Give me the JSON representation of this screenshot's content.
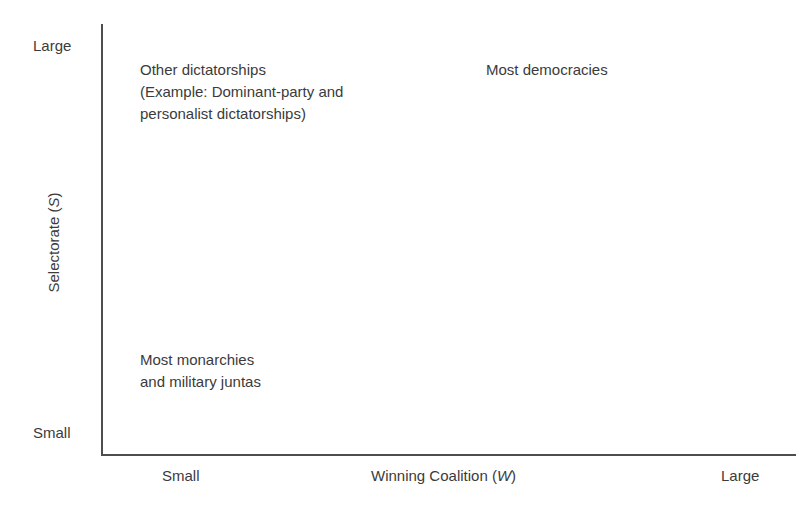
{
  "figure": {
    "background_color": "#ffffff",
    "text_color": "#3b3b3b",
    "axis_color": "#4d4d4d"
  },
  "chart_data": {
    "type": "scatter",
    "title": "",
    "xlabel": "Winning Coalition (W)",
    "ylabel": "Selectorate (S)",
    "xlabel_text": "Winning Coalition (",
    "xlabel_var": "W",
    "xlabel_tail": ")",
    "ylabel_text": "Selectorate (",
    "ylabel_var": "S",
    "ylabel_tail": ")",
    "x_ticks": [
      "Small",
      "Large"
    ],
    "y_ticks": [
      "Small",
      "Large"
    ],
    "grid": false,
    "legend": "none",
    "annotations": [
      {
        "label": "Other dictatorships\n(Example: Dominant-party and\npersonalist dictatorships)",
        "quadrant": "top-left",
        "x": "small W",
        "y": "large S"
      },
      {
        "label": "Most democracies",
        "quadrant": "top-right",
        "x": "large W",
        "y": "large S"
      },
      {
        "label": "Most monarchies\nand military juntas",
        "quadrant": "bottom-left",
        "x": "small W",
        "y": "small S"
      }
    ]
  },
  "axes": {
    "y_top_label": "Large",
    "y_bottom_label": "Small",
    "x_left_label": "Small",
    "x_right_label": "Large"
  },
  "notes": {
    "other_dictatorships": "Other dictatorships\n(Example: Dominant-party and\npersonalist dictatorships)",
    "most_democracies": "Most democracies",
    "most_monarchies": "Most monarchies\nand military juntas"
  }
}
